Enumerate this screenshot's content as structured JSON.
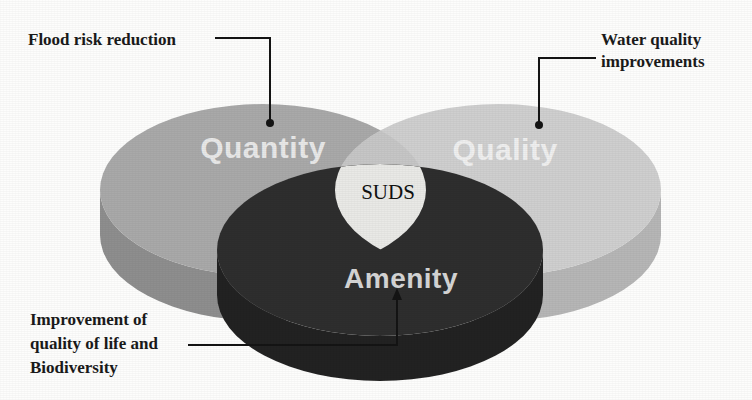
{
  "figure": {
    "type": "venn-3d",
    "background_color": "#fdfdfc",
    "center_label": "SUDS",
    "center_label_color": "#111111"
  },
  "discs": [
    {
      "id": "quantity",
      "label": "Quantity",
      "label_color": "#e8e8e8",
      "top_color": "#a9a9a9",
      "side_color": "#8e8e8e",
      "center_x": 263,
      "center_y": 190,
      "radius_x": 163,
      "radius_y": 86,
      "depth": 45
    },
    {
      "id": "quality",
      "label": "Quality",
      "label_color": "#efefef",
      "top_color": "#cfcfcf",
      "side_color": "#b6b6b6",
      "center_x": 498,
      "center_y": 190,
      "radius_x": 163,
      "radius_y": 86,
      "depth": 45
    },
    {
      "id": "amenity",
      "label": "Amenity",
      "label_color": "#d5d5d5",
      "top_color": "#2f2f2f",
      "side_color": "#242424",
      "center_x": 380,
      "center_y": 250,
      "radius_x": 163,
      "radius_y": 86,
      "depth": 45
    }
  ],
  "callouts": [
    {
      "id": "flood-risk",
      "lines": [
        "Flood risk reduction"
      ],
      "target_disc": "quantity",
      "marker": "dot",
      "line_color": "#141414"
    },
    {
      "id": "water-quality",
      "lines": [
        "Water quality",
        "improvements"
      ],
      "target_disc": "quality",
      "marker": "dot",
      "line_color": "#141414"
    },
    {
      "id": "amenity-benefit",
      "lines": [
        "Improvement of",
        "quality of life and",
        "Biodiversity"
      ],
      "target_disc": "amenity",
      "marker": "arrow",
      "line_color": "#141414"
    }
  ]
}
